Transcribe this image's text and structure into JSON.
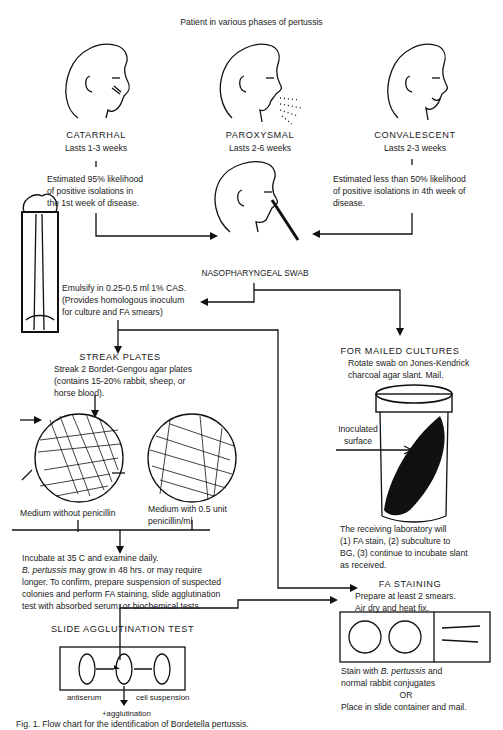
{
  "title": "Patient in various phases of pertussis",
  "phases": [
    {
      "name": "CATARRHAL",
      "duration": "Lasts 1-3 weeks",
      "note": [
        "Estimated 95% likelihood",
        "of positive isolations in",
        "the 1st week of disease."
      ]
    },
    {
      "name": "PAROXYSMAL",
      "duration": "Lasts 2-6 weeks"
    },
    {
      "name": "CONVALESCENT",
      "duration": "Lasts 2-3 weeks",
      "note": [
        "Estimated less than 50% likelihood",
        "of positive isolations in 4th week of",
        "disease."
      ]
    }
  ],
  "swab": {
    "label": "NASOPHARYNGEAL SWAB"
  },
  "emulsify": {
    "lines": [
      "Emulsify in 0.25-0.5 ml 1% CAS.",
      "(Provides homologous inoculum",
      "for culture and FA smears)"
    ]
  },
  "streak": {
    "heading": "STREAK PLATES",
    "lines": [
      "Streak 2 Bordet-Gengou agar plates",
      "(contains 15-20% rabbit, sheep, or",
      "horse blood)."
    ],
    "plate_left": "Medium without penicillin",
    "plate_right": [
      "Medium with 0.5 unit",
      "penicillin/ml"
    ]
  },
  "mailed": {
    "heading": "FOR MAILED CULTURES",
    "lines": [
      "Rotate swab on Jones-Kendrick",
      "charcoal agar slant. Mail."
    ],
    "inoculated": [
      "Inoculated",
      "surface"
    ],
    "receiving": [
      "The receiving laboratory will",
      "(1) FA stain, (2) subculture to",
      "BG, (3) continue to incubate slant",
      "as received."
    ]
  },
  "incubate": {
    "line1": "Incubate at 35 C and examine daily.",
    "species": "B. pertussis",
    "line2_rest": " may grow in 48 hrs. or may require",
    "lines": [
      "longer. To confirm, prepare suspension of suspected",
      "colonies and perform FA staining, slide agglutination",
      "test with absorbed serum, or biochemical tests."
    ]
  },
  "fa": {
    "heading": "FA STAINING",
    "lines": [
      "Prepare at least 2 smears.",
      "Air dry and heat fix."
    ],
    "stain_prefix": "Stain with ",
    "species": "B. pertussis",
    "stain_suffix": " and",
    "stain_line2": "normal rabbit conjugates",
    "or": "OR",
    "mail": "Place in slide container and mail."
  },
  "agglutination": {
    "heading": "SLIDE AGGLUTINATION TEST",
    "antiserum": "antiserum",
    "cell": "cell suspension",
    "result": "+agglutination"
  },
  "caption": "Fig. 1.  Flow chart for the identification of Bordetella pertussis."
}
